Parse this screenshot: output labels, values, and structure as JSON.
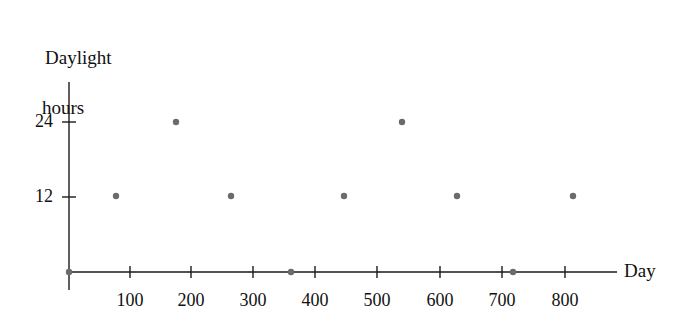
{
  "chart_data": {
    "type": "scatter",
    "title": "",
    "ylabel_line1": "Daylight",
    "ylabel_line2": "hours",
    "xlabel": "Day",
    "x": [
      0,
      77,
      175,
      265,
      360,
      445,
      540,
      630,
      720,
      815
    ],
    "values": [
      0,
      12,
      24,
      12,
      0,
      12,
      24,
      12,
      0,
      12
    ],
    "xticks": [
      100,
      200,
      300,
      400,
      500,
      600,
      700,
      800
    ],
    "xtick_labels": [
      "100",
      "200",
      "300",
      "400",
      "500",
      "600",
      "700",
      "800"
    ],
    "yticks": [
      12,
      24
    ],
    "ytick_labels": [
      "12",
      "24"
    ],
    "xlim": [
      0,
      895
    ],
    "ylim": [
      0,
      33
    ],
    "grid": false,
    "legend": "none",
    "point_color": "#6b6b6b",
    "axis_color": "#1a1a1a",
    "point_radius": 3.2
  },
  "axes": {
    "origin_x": 69,
    "origin_y": 272,
    "x_axis_end": 617,
    "y_axis_top": 82,
    "y_axis_bottom": 290,
    "px_per_day": 0.62,
    "px_per_hour": 6.25
  },
  "points": [
    {
      "day": 0,
      "hours": 0,
      "cx": 69,
      "cy": 272
    },
    {
      "day": 77,
      "hours": 12,
      "cx": 116,
      "cy": 196
    },
    {
      "day": 175,
      "hours": 24,
      "cx": 176,
      "cy": 122
    },
    {
      "day": 265,
      "hours": 12,
      "cx": 231,
      "cy": 196
    },
    {
      "day": 360,
      "hours": 0,
      "cx": 291,
      "cy": 272
    },
    {
      "day": 445,
      "hours": 12,
      "cx": 344,
      "cy": 196
    },
    {
      "day": 540,
      "hours": 24,
      "cx": 402,
      "cy": 122
    },
    {
      "day": 630,
      "hours": 12,
      "cx": 457,
      "cy": 196
    },
    {
      "day": 720,
      "hours": 0,
      "cx": 513,
      "cy": 272
    },
    {
      "day": 815,
      "hours": 12,
      "cx": 573,
      "cy": 196
    }
  ],
  "xtick_positions": [
    {
      "label": "100",
      "x": 130
    },
    {
      "label": "200",
      "x": 191
    },
    {
      "label": "300",
      "x": 253
    },
    {
      "label": "400",
      "x": 315
    },
    {
      "label": "500",
      "x": 377
    },
    {
      "label": "600",
      "x": 440
    },
    {
      "label": "700",
      "x": 502
    },
    {
      "label": "800",
      "x": 565
    }
  ],
  "ytick_positions": [
    {
      "label": "24",
      "y": 122
    },
    {
      "label": "12",
      "y": 197
    }
  ]
}
